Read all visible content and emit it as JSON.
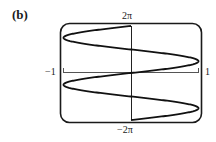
{
  "figure": {
    "panel_label": "(b)"
  },
  "chart_data": {
    "type": "line",
    "title": "",
    "panel_label": "(b)",
    "equation_depicted": "x = sin(y)",
    "xlabel": "",
    "ylabel": "",
    "xlim": [
      -1,
      1
    ],
    "ylim": [
      "-2π",
      "2π"
    ],
    "ylim_numeric": [
      -6.2832,
      6.2832
    ],
    "x_tick_labels": [
      "-1",
      "1"
    ],
    "y_tick_labels": [
      "2π",
      "-2π"
    ],
    "grid": false,
    "legend": null,
    "frame": "rounded-rectangle",
    "series": [
      {
        "name": "curve",
        "parametric": true,
        "y": [
          -6.2832,
          -4.7124,
          -3.1416,
          -1.5708,
          0,
          1.5708,
          3.1416,
          4.7124,
          6.2832
        ],
        "x": [
          0,
          1,
          0,
          -1,
          0,
          1,
          0,
          -1,
          0
        ]
      }
    ],
    "labels": {
      "top": "2π",
      "bottom": "−2π",
      "left": "−1",
      "right": "1"
    }
  }
}
